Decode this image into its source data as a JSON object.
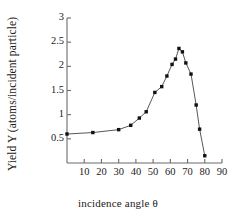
{
  "chart_data": {
    "type": "line",
    "title": "",
    "xlabel": "incidence angle θ",
    "ylabel": "Yield Y (atoms/incident particle)",
    "xlim": [
      0,
      90
    ],
    "ylim": [
      0,
      3
    ],
    "xticks": [
      10,
      20,
      30,
      40,
      50,
      60,
      70,
      80,
      90
    ],
    "yticks": [
      0.5,
      1,
      1.5,
      2,
      2.5,
      3
    ],
    "xtick_labels": [
      "10",
      "20",
      "30",
      "40",
      "50",
      "60",
      "70",
      "80",
      "90"
    ],
    "ytick_labels": [
      "0.5",
      "1",
      "1.5",
      "2",
      "2.5",
      "3"
    ],
    "grid": false,
    "legend": false,
    "marker": "filled-square",
    "line_color": "#444444",
    "marker_color": "#111111",
    "series": [
      {
        "name": "Yield Y",
        "x": [
          0,
          15,
          30,
          37,
          42,
          46,
          51,
          55,
          58,
          61,
          63,
          65,
          67,
          69,
          72,
          75,
          77,
          80
        ],
        "y": [
          0.6,
          0.63,
          0.69,
          0.78,
          0.93,
          1.06,
          1.46,
          1.58,
          1.8,
          2.04,
          2.15,
          2.37,
          2.3,
          2.07,
          1.84,
          1.2,
          0.7,
          0.15
        ]
      }
    ]
  },
  "axis": {
    "x_axis_name": "x-axis",
    "y_axis_name": "y-axis"
  }
}
